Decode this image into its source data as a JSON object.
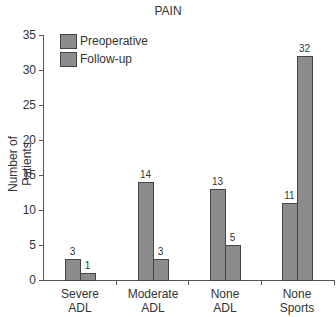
{
  "chart_data": {
    "type": "bar",
    "title": "PAIN",
    "xlabel": "",
    "ylabel": "Number of Patients",
    "ylim": [
      0,
      35
    ],
    "yticks": [
      0,
      5,
      10,
      15,
      20,
      25,
      30,
      35
    ],
    "grid": false,
    "legend_position": "top-left",
    "categories": [
      "Severe ADL",
      "Moderate ADL",
      "None ADL",
      "None Sports"
    ],
    "category_lines": [
      [
        "Severe",
        "ADL"
      ],
      [
        "Moderate",
        "ADL"
      ],
      [
        "None",
        "ADL"
      ],
      [
        "None",
        "Sports"
      ]
    ],
    "series": [
      {
        "name": "Preoperative",
        "values": [
          3,
          14,
          13,
          11
        ],
        "color": "#8c8c8c"
      },
      {
        "name": "Follow-up",
        "values": [
          1,
          3,
          5,
          32
        ],
        "color": "#8c8c8c"
      }
    ]
  }
}
